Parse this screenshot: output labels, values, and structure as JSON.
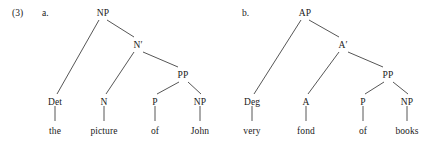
{
  "example": {
    "number": "(3)",
    "number_x": 12,
    "number_y": 8
  },
  "trees": [
    {
      "id": "tree-a",
      "letter": "a.",
      "letter_x": 42,
      "letter_y": 8,
      "nodes": [
        {
          "id": "a-NP",
          "label": "NP",
          "x": 103,
          "y": 8,
          "kind": "node"
        },
        {
          "id": "a-Nbar",
          "label": "N′",
          "x": 138,
          "y": 40,
          "kind": "node"
        },
        {
          "id": "a-PP",
          "label": "PP",
          "x": 183,
          "y": 70,
          "kind": "node"
        },
        {
          "id": "a-Det",
          "label": "Det",
          "x": 55,
          "y": 97,
          "kind": "node"
        },
        {
          "id": "a-N",
          "label": "N",
          "x": 104,
          "y": 97,
          "kind": "node"
        },
        {
          "id": "a-P",
          "label": "P",
          "x": 155,
          "y": 97,
          "kind": "node"
        },
        {
          "id": "a-NP2",
          "label": "NP",
          "x": 200,
          "y": 97,
          "kind": "node"
        },
        {
          "id": "a-w1",
          "label": "the",
          "x": 55,
          "y": 126,
          "kind": "leaf"
        },
        {
          "id": "a-w2",
          "label": "picture",
          "x": 104,
          "y": 126,
          "kind": "leaf"
        },
        {
          "id": "a-w3",
          "label": "of",
          "x": 155,
          "y": 126,
          "kind": "leaf"
        },
        {
          "id": "a-w4",
          "label": "John",
          "x": 200,
          "y": 126,
          "kind": "leaf"
        }
      ],
      "edges": [
        {
          "x1": 99,
          "y1": 20,
          "x2": 57,
          "y2": 94
        },
        {
          "x1": 107,
          "y1": 20,
          "x2": 134,
          "y2": 37
        },
        {
          "x1": 134,
          "y1": 52,
          "x2": 106,
          "y2": 94
        },
        {
          "x1": 143,
          "y1": 52,
          "x2": 178,
          "y2": 67
        },
        {
          "x1": 179,
          "y1": 82,
          "x2": 157,
          "y2": 94
        },
        {
          "x1": 188,
          "y1": 82,
          "x2": 201,
          "y2": 94
        },
        {
          "x1": 55,
          "y1": 106,
          "x2": 55,
          "y2": 121
        },
        {
          "x1": 104,
          "y1": 106,
          "x2": 104,
          "y2": 121
        },
        {
          "x1": 155,
          "y1": 106,
          "x2": 155,
          "y2": 121
        },
        {
          "x1": 200,
          "y1": 106,
          "x2": 200,
          "y2": 121
        }
      ]
    },
    {
      "id": "tree-b",
      "letter": "b.",
      "letter_x": 242,
      "letter_y": 8,
      "nodes": [
        {
          "id": "b-AP",
          "label": "AP",
          "x": 305,
          "y": 8,
          "kind": "node"
        },
        {
          "id": "b-Abar",
          "label": "A′",
          "x": 343,
          "y": 40,
          "kind": "node"
        },
        {
          "id": "b-PP",
          "label": "PP",
          "x": 388,
          "y": 70,
          "kind": "node"
        },
        {
          "id": "b-Deg",
          "label": "Deg",
          "x": 252,
          "y": 97,
          "kind": "node"
        },
        {
          "id": "b-A",
          "label": "A",
          "x": 306,
          "y": 97,
          "kind": "node"
        },
        {
          "id": "b-P",
          "label": "P",
          "x": 363,
          "y": 97,
          "kind": "node"
        },
        {
          "id": "b-NP",
          "label": "NP",
          "x": 407,
          "y": 97,
          "kind": "node"
        },
        {
          "id": "b-w1",
          "label": "very",
          "x": 252,
          "y": 126,
          "kind": "leaf"
        },
        {
          "id": "b-w2",
          "label": "fond",
          "x": 306,
          "y": 126,
          "kind": "leaf"
        },
        {
          "id": "b-w3",
          "label": "of",
          "x": 363,
          "y": 126,
          "kind": "leaf"
        },
        {
          "id": "b-w4",
          "label": "books",
          "x": 407,
          "y": 126,
          "kind": "leaf"
        }
      ],
      "edges": [
        {
          "x1": 301,
          "y1": 20,
          "x2": 254,
          "y2": 94
        },
        {
          "x1": 309,
          "y1": 20,
          "x2": 339,
          "y2": 37
        },
        {
          "x1": 339,
          "y1": 52,
          "x2": 308,
          "y2": 94
        },
        {
          "x1": 348,
          "y1": 52,
          "x2": 383,
          "y2": 67
        },
        {
          "x1": 384,
          "y1": 82,
          "x2": 365,
          "y2": 94
        },
        {
          "x1": 393,
          "y1": 82,
          "x2": 408,
          "y2": 94
        },
        {
          "x1": 252,
          "y1": 106,
          "x2": 252,
          "y2": 121
        },
        {
          "x1": 306,
          "y1": 106,
          "x2": 306,
          "y2": 121
        },
        {
          "x1": 363,
          "y1": 106,
          "x2": 363,
          "y2": 121
        },
        {
          "x1": 407,
          "y1": 106,
          "x2": 407,
          "y2": 121
        }
      ]
    }
  ],
  "colors": {
    "background": "#ffffff",
    "text": "#1a1a1a",
    "edge": "#2b2b2b"
  }
}
